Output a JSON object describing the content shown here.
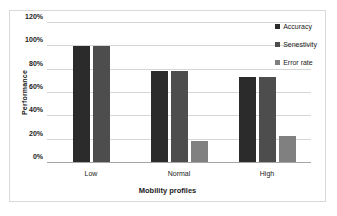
{
  "chart_data": {
    "type": "bar",
    "title": "",
    "xlabel": "Mobility profiles",
    "ylabel": "Performance",
    "categories": [
      "Low",
      "Normal",
      "High"
    ],
    "series": [
      {
        "name": "Accuracy",
        "values": [
          100,
          79,
          74
        ],
        "color": "#2b2b2b"
      },
      {
        "name": "Senestivity",
        "values": [
          100,
          79,
          74
        ],
        "color": "#4d4d4d"
      },
      {
        "name": "Error rate",
        "values": [
          0,
          19,
          23
        ],
        "color": "#808080"
      }
    ],
    "ylim": [
      0,
      120
    ],
    "yticks": [
      "0%",
      "20%",
      "40%",
      "60%",
      "80%",
      "100%",
      "120%"
    ],
    "ytick_values": [
      0,
      20,
      40,
      60,
      80,
      100,
      120
    ],
    "grid": true,
    "legend_position": "top-right"
  },
  "colors": {
    "frame_border": "#d9d9d9",
    "gridline": "#d6d6d6",
    "axis": "#a6a6a6",
    "background": "#ffffff"
  }
}
